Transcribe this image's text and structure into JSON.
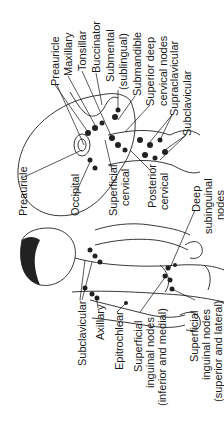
{
  "figure": {
    "background": "#ffffff",
    "line_color": "#222222",
    "orientation": "rotated 90 degrees counter-clockwise"
  },
  "head_labels": {
    "preauricle": "Preauricle",
    "maxillary": "Maxillary",
    "tonsillar": "Tonsillar",
    "buccinator": "Buccinator",
    "submental_1": "Submental",
    "submental_2": "(sublingual)",
    "submandible": "Submandible",
    "superior_deep_1": "Superior deep",
    "superior_deep_2": "cervical nodes",
    "supraclavicular": "Supraclavicular",
    "subclavicular": "Subclavicular"
  },
  "body_labels": {
    "preauricle": "Preauricle",
    "occipital": "Occipital",
    "superficial_cervical_1": "Superficial",
    "superficial_cervical_2": "cervical",
    "posterior_cervical_1": "Posterior",
    "posterior_cervical_2": "cervical",
    "deep_subinguinal_1": "Deep",
    "deep_subinguinal_2": "subinguinal",
    "deep_subinguinal_3": "nodes",
    "subclavicular": "Subclavicular",
    "axillary": "Axillary",
    "epitrochlear": "Epitrochlear",
    "sup_inguinal_im_1": "Superficial",
    "sup_inguinal_im_2": "inguinal nodes",
    "sup_inguinal_im_3": "(inferior and medial)",
    "sup_inguinal_sl_1": "Superficial",
    "sup_inguinal_sl_2": "inguinal nodes",
    "sup_inguinal_sl_3": "(superior and lateral)"
  }
}
